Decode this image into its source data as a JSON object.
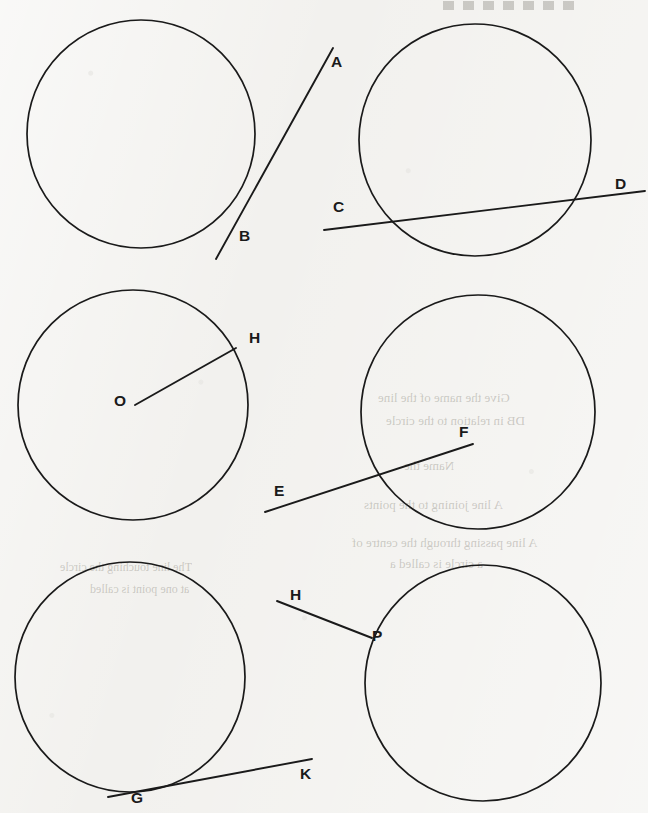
{
  "page": {
    "width": 648,
    "height": 813,
    "background_color": "#f2f1ee",
    "ink_color": "#1a1a1a"
  },
  "figures": [
    {
      "id": "figure-1",
      "name": "circle-with-tangent-ab",
      "circle": {
        "cx": 141,
        "cy": 134,
        "r": 114
      },
      "relationship": "tangent",
      "lines": [
        {
          "name": "line-ab",
          "x1": 333,
          "y1": 48,
          "x2": 216,
          "y2": 259
        }
      ],
      "labels": [
        {
          "text": "A",
          "x": 331,
          "y": 67
        },
        {
          "text": "B",
          "x": 239,
          "y": 241
        }
      ]
    },
    {
      "id": "figure-2",
      "name": "circle-with-secant-cd",
      "circle": {
        "cx": 475,
        "cy": 140,
        "r": 116
      },
      "relationship": "secant",
      "lines": [
        {
          "name": "line-cd",
          "x1": 324,
          "y1": 230,
          "x2": 645,
          "y2": 191
        }
      ],
      "labels": [
        {
          "text": "C",
          "x": 333,
          "y": 212
        },
        {
          "text": "D",
          "x": 615,
          "y": 189
        }
      ]
    },
    {
      "id": "figure-3",
      "name": "circle-with-radius-oh",
      "circle": {
        "cx": 133,
        "cy": 405,
        "r": 115
      },
      "relationship": "radius",
      "lines": [
        {
          "name": "line-oh",
          "x1": 135,
          "y1": 405,
          "x2": 236,
          "y2": 348
        }
      ],
      "labels": [
        {
          "text": "O",
          "x": 114,
          "y": 406
        },
        {
          "text": "H",
          "x": 249,
          "y": 343
        }
      ]
    },
    {
      "id": "figure-4",
      "name": "circle-with-chord-ef",
      "circle": {
        "cx": 478,
        "cy": 412,
        "r": 117
      },
      "relationship": "chord-entering",
      "lines": [
        {
          "name": "line-ef",
          "x1": 265,
          "y1": 512,
          "x2": 473,
          "y2": 444
        }
      ],
      "labels": [
        {
          "text": "E",
          "x": 274,
          "y": 496
        },
        {
          "text": "F",
          "x": 459,
          "y": 437
        }
      ]
    },
    {
      "id": "figure-5",
      "name": "circle-with-tangent-gk",
      "circle": {
        "cx": 130,
        "cy": 677,
        "r": 115
      },
      "relationship": "tangent",
      "lines": [
        {
          "name": "line-gk",
          "x1": 108,
          "y1": 797,
          "x2": 312,
          "y2": 759
        }
      ],
      "labels": [
        {
          "text": "G",
          "x": 131,
          "y": 803
        },
        {
          "text": "K",
          "x": 300,
          "y": 779
        }
      ]
    },
    {
      "id": "figure-6",
      "name": "circle-with-tangent-hp",
      "circle": {
        "cx": 483,
        "cy": 683,
        "r": 118
      },
      "relationship": "point-of-contact",
      "lines": [
        {
          "name": "line-hp",
          "x1": 277,
          "y1": 601,
          "x2": 372,
          "y2": 638
        }
      ],
      "labels": [
        {
          "text": "H",
          "x": 290,
          "y": 600
        },
        {
          "text": "P",
          "x": 372,
          "y": 641
        }
      ]
    }
  ],
  "point_labels": [
    "A",
    "B",
    "C",
    "D",
    "O",
    "H",
    "E",
    "F",
    "G",
    "K",
    "H",
    "P"
  ],
  "ghost_text": [
    {
      "text": "Give the name of the line",
      "x": 378,
      "y": 390,
      "size": 13
    },
    {
      "text": "DB in relation to the circle",
      "x": 386,
      "y": 413,
      "size": 13
    },
    {
      "text": "Name the",
      "x": 404,
      "y": 458,
      "size": 13
    },
    {
      "text": "A line joining to the points",
      "x": 364,
      "y": 497,
      "size": 13
    },
    {
      "text": "A line passing through the centre of",
      "x": 352,
      "y": 535,
      "size": 13
    },
    {
      "text": "a circle is called a",
      "x": 390,
      "y": 556,
      "size": 13
    },
    {
      "text": "The line touching the circle",
      "x": 60,
      "y": 560,
      "size": 12
    },
    {
      "text": "at one point is called",
      "x": 90,
      "y": 582,
      "size": 12
    }
  ],
  "scan_artifact": {
    "name": "top-edge-scan-marks",
    "x": 443,
    "y": 1,
    "width": 138,
    "height": 9
  }
}
